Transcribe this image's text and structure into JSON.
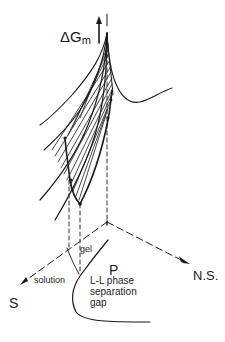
{
  "figure": {
    "type": "phase diagram (free energy surface with L-L phase separation gap)",
    "axis_vertical_label": "ΔG",
    "axis_vertical_subscript": "m",
    "axis_labels": {
      "origin": "P",
      "right": "N.S.",
      "left": "S"
    },
    "region_labels": {
      "gel": "gel",
      "solution": "solution",
      "gap_line1": "L-L phase",
      "gap_line2": "separation",
      "gap_line3": "gap"
    },
    "colors": {
      "ink": "#1a1a1a",
      "background": "#ffffff"
    }
  }
}
